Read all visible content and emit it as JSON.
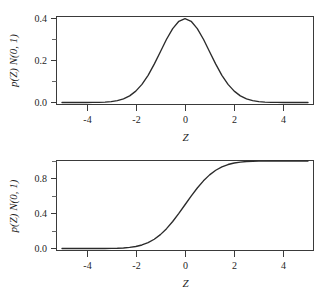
{
  "figure": {
    "background_color": "#ffffff",
    "line_color": "#2b2b2b",
    "axis_color": "#3a3a3a",
    "panel_count": 2
  },
  "chart_data": [
    {
      "type": "line",
      "title": "",
      "panel_name": "standard-normal-pdf",
      "xlabel": "Z",
      "ylabel": "p(Z) N(0, 1)",
      "xlim": [
        -5,
        5
      ],
      "ylim": [
        0.0,
        0.42
      ],
      "grid": false,
      "legend": "none",
      "xticks": [
        -4,
        -2,
        0,
        2,
        4
      ],
      "xticklabels": [
        "-4",
        "-2",
        "0",
        "2",
        "4"
      ],
      "yticks": [
        0.0,
        0.2,
        0.4
      ],
      "yticklabels": [
        "0.0",
        "0.2",
        "0.4"
      ],
      "yticks_minor": [
        0.1,
        0.3
      ],
      "series": [
        {
          "name": "N(0, 1) density",
          "x": [
            -5.0,
            -4.75,
            -4.5,
            -4.25,
            -4.0,
            -3.75,
            -3.5,
            -3.25,
            -3.0,
            -2.75,
            -2.5,
            -2.25,
            -2.0,
            -1.75,
            -1.5,
            -1.25,
            -1.0,
            -0.75,
            -0.5,
            -0.25,
            0.0,
            0.25,
            0.5,
            0.75,
            1.0,
            1.25,
            1.5,
            1.75,
            2.0,
            2.25,
            2.5,
            2.75,
            3.0,
            3.25,
            3.5,
            3.75,
            4.0,
            4.25,
            4.5,
            4.75,
            5.0
          ],
          "values": [
            1.5e-06,
            4.3e-06,
            1.6e-05,
            4.65e-05,
            0.0001338,
            0.0003746,
            0.0008727,
            0.0020374,
            0.0044318,
            0.0090936,
            0.0175283,
            0.031668,
            0.053991,
            0.0862773,
            0.1295176,
            0.1826491,
            0.2419707,
            0.3011374,
            0.3520653,
            0.3866681,
            0.3989423,
            0.3866681,
            0.3520653,
            0.3011374,
            0.2419707,
            0.1826491,
            0.1295176,
            0.0862773,
            0.053991,
            0.031668,
            0.0175283,
            0.0090936,
            0.0044318,
            0.0020374,
            0.0008727,
            0.0003746,
            0.0001338,
            4.65e-05,
            1.6e-05,
            4.3e-06,
            1.5e-06
          ]
        }
      ],
      "peak_value": 0.3989,
      "peak_x": 0
    },
    {
      "type": "line",
      "title": "",
      "panel_name": "standard-normal-cdf",
      "xlabel": "Z",
      "ylabel": "p(Z) N(0, 1)",
      "xlim": [
        -5,
        5
      ],
      "ylim": [
        0.0,
        1.0
      ],
      "grid": false,
      "legend": "none",
      "xticks": [
        -4,
        -2,
        0,
        2,
        4
      ],
      "xticklabels": [
        "-4",
        "-2",
        "0",
        "2",
        "4"
      ],
      "yticks": [
        0.0,
        0.4,
        0.8
      ],
      "yticklabels": [
        "0.0",
        "0.4",
        "0.8"
      ],
      "yticks_minor": [
        0.2,
        0.6,
        1.0
      ],
      "series": [
        {
          "name": "N(0, 1) cumulative distribution",
          "x": [
            -5.0,
            -4.75,
            -4.5,
            -4.25,
            -4.0,
            -3.75,
            -3.5,
            -3.25,
            -3.0,
            -2.75,
            -2.5,
            -2.25,
            -2.0,
            -1.75,
            -1.5,
            -1.25,
            -1.0,
            -0.75,
            -0.5,
            -0.25,
            0.0,
            0.25,
            0.5,
            0.75,
            1.0,
            1.25,
            1.5,
            1.75,
            2.0,
            2.25,
            2.5,
            2.75,
            3.0,
            3.25,
            3.5,
            3.75,
            4.0,
            4.25,
            4.5,
            4.75,
            5.0
          ],
          "values": [
            3e-07,
            1e-06,
            3.4e-06,
            1.07e-05,
            3.17e-05,
            8.84e-05,
            0.0002326,
            0.000577,
            0.0013499,
            0.0029798,
            0.0062097,
            0.0122245,
            0.0227501,
            0.0400592,
            0.0668072,
            0.1056498,
            0.1586553,
            0.2266274,
            0.3085375,
            0.4012937,
            0.5,
            0.5987063,
            0.6914625,
            0.7733726,
            0.8413447,
            0.8943502,
            0.9331928,
            0.9599408,
            0.9772499,
            0.9877755,
            0.9937903,
            0.9970202,
            0.9986501,
            0.999423,
            0.9997674,
            0.9999116,
            0.9999683,
            0.9999893,
            0.9999966,
            0.999999,
            0.9999997
          ]
        }
      ],
      "midpoint_value": 0.5,
      "midpoint_x": 0
    }
  ]
}
